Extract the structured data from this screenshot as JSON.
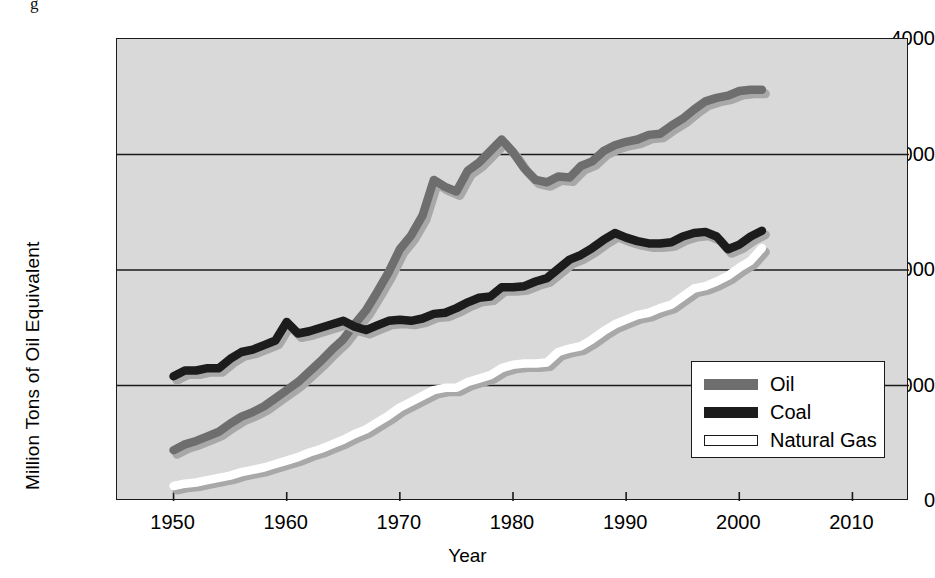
{
  "figure": {
    "background_color": "#ffffff",
    "plot_background_color": "#d9d9d9",
    "frame_color": "#1a1a1a",
    "top_fragment": "g"
  },
  "legend": {
    "position": "inside-lower-right",
    "entries": [
      {
        "label": "Oil",
        "color": "#6e6e6e",
        "border": "#6e6e6e"
      },
      {
        "label": "Coal",
        "color": "#1c1c1c",
        "border": "#1c1c1c"
      },
      {
        "label": "Natural Gas",
        "color": "#ffffff",
        "border": "#1a1a1a"
      }
    ]
  },
  "chart_data": {
    "type": "line",
    "title": "",
    "xlabel": "Year",
    "ylabel": "Million Tons of Oil Equivalent",
    "xlim": [
      1945,
      2015
    ],
    "ylim": [
      0,
      4000
    ],
    "xticks": [
      1950,
      1960,
      1970,
      1980,
      1990,
      2000,
      2010
    ],
    "yticks": [
      0,
      1000,
      2000,
      3000,
      4000
    ],
    "grid": "horizontal",
    "legend_position": "lower right",
    "x": [
      1950,
      1951,
      1952,
      1953,
      1954,
      1955,
      1956,
      1957,
      1958,
      1959,
      1960,
      1961,
      1962,
      1963,
      1964,
      1965,
      1966,
      1967,
      1968,
      1969,
      1970,
      1971,
      1972,
      1973,
      1974,
      1975,
      1976,
      1977,
      1978,
      1979,
      1980,
      1981,
      1982,
      1983,
      1984,
      1985,
      1986,
      1987,
      1988,
      1989,
      1990,
      1991,
      1992,
      1993,
      1994,
      1995,
      1996,
      1997,
      1998,
      1999,
      2000,
      2001,
      2002
    ],
    "series": [
      {
        "name": "Oil",
        "color": "#6e6e6e",
        "values": [
          440,
          490,
          520,
          560,
          600,
          670,
          730,
          770,
          820,
          890,
          960,
          1030,
          1120,
          1210,
          1310,
          1400,
          1530,
          1650,
          1810,
          1980,
          2180,
          2300,
          2470,
          2780,
          2720,
          2680,
          2860,
          2930,
          3030,
          3130,
          3020,
          2880,
          2780,
          2760,
          2810,
          2800,
          2900,
          2940,
          3030,
          3080,
          3110,
          3130,
          3170,
          3180,
          3250,
          3310,
          3390,
          3460,
          3490,
          3510,
          3550,
          3560,
          3560
        ]
      },
      {
        "name": "Coal",
        "color": "#1c1c1c",
        "values": [
          1080,
          1130,
          1130,
          1150,
          1150,
          1230,
          1290,
          1310,
          1350,
          1390,
          1550,
          1450,
          1470,
          1500,
          1530,
          1560,
          1510,
          1480,
          1520,
          1560,
          1570,
          1560,
          1580,
          1620,
          1630,
          1670,
          1720,
          1760,
          1770,
          1850,
          1850,
          1860,
          1900,
          1930,
          2010,
          2090,
          2130,
          2190,
          2260,
          2320,
          2280,
          2250,
          2230,
          2230,
          2240,
          2290,
          2320,
          2330,
          2290,
          2180,
          2220,
          2290,
          2340
        ]
      },
      {
        "name": "Natural Gas",
        "color": "#ffffff",
        "values": [
          130,
          150,
          160,
          180,
          200,
          220,
          250,
          270,
          290,
          320,
          350,
          380,
          420,
          450,
          490,
          530,
          580,
          620,
          680,
          740,
          810,
          860,
          910,
          960,
          980,
          980,
          1030,
          1060,
          1090,
          1150,
          1180,
          1190,
          1190,
          1200,
          1290,
          1320,
          1340,
          1400,
          1470,
          1530,
          1570,
          1610,
          1630,
          1670,
          1700,
          1770,
          1840,
          1860,
          1900,
          1950,
          2020,
          2080,
          2190
        ]
      }
    ]
  }
}
